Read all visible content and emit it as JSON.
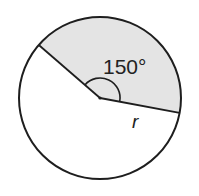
{
  "figure": {
    "type": "circle-sector",
    "center": {
      "x": 100,
      "y": 98
    },
    "radius": 81,
    "sector": {
      "central_angle_label": "150°",
      "central_angle_degrees": 150,
      "shaded": true,
      "fill_color": "#e4e4e4"
    },
    "radius_label": "r",
    "colors": {
      "stroke": "#1e1e1e",
      "background": "#ffffff",
      "shading": "#e4e4e4"
    }
  }
}
